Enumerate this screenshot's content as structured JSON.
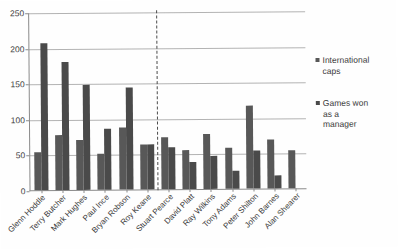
{
  "chart_data": {
    "type": "bar",
    "title": "",
    "subtitle": "",
    "xlabel": "",
    "ylabel": "",
    "ylim": [
      0,
      250
    ],
    "yticks": [
      0,
      50,
      100,
      150,
      200,
      250
    ],
    "grid": true,
    "legend_position": "right",
    "categories": [
      "Glenn Hoddle",
      "Terry Butcher",
      "Mark Hughes",
      "Paul Ince",
      "Bryan Robson",
      "Roy Keane",
      "Stuart Pearce",
      "David Platt",
      "Ray Wilkins",
      "Tony Adams",
      "Peter Shilton",
      "John Barnes",
      "Alan Shearer"
    ],
    "series": [
      {
        "name": "International caps",
        "color": "#585858",
        "values": [
          53,
          77,
          70,
          51,
          87,
          63,
          73,
          55,
          78,
          58,
          117,
          69,
          53
        ]
      },
      {
        "name": "Games won as a manager",
        "color": "#4a4a4a",
        "values": [
          208,
          181,
          149,
          86,
          144,
          64,
          59,
          38,
          46,
          25,
          53,
          19,
          0
        ]
      }
    ],
    "annotations": [
      {
        "name": "vertical-divider",
        "type": "dashed-vertical-line",
        "after_category": "Roy Keane"
      }
    ]
  },
  "legend": {
    "items": [
      {
        "label": "International\ncaps",
        "icon": "legend-square-icon"
      },
      {
        "label": "Games won\nas a\nmanager",
        "icon": "legend-square-icon"
      }
    ]
  }
}
